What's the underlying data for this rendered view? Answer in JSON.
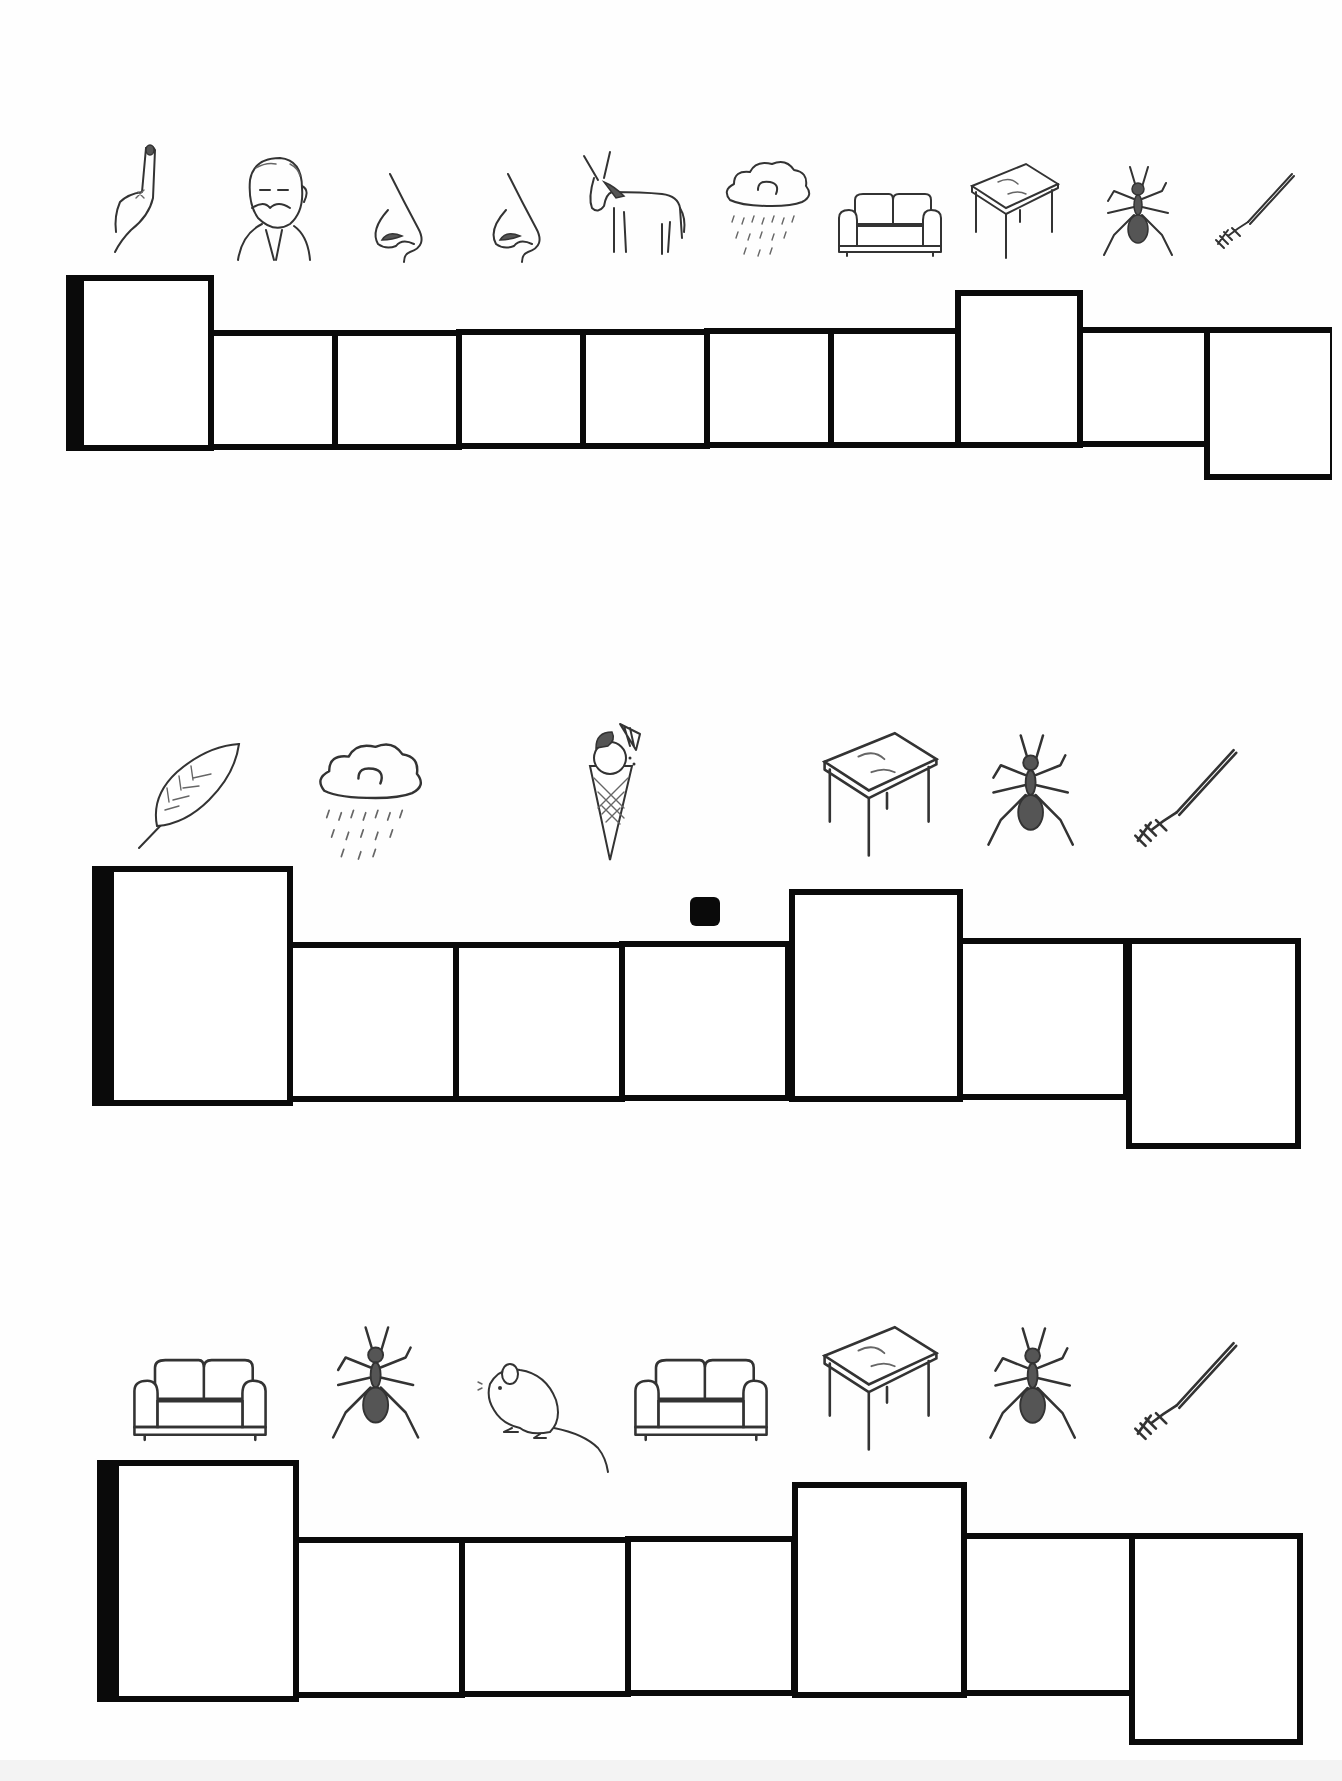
{
  "worksheet": {
    "rows": [
      {
        "pictures": [
          "finger",
          "old-man",
          "nose",
          "nose",
          "donkey",
          "rain-cloud",
          "sofa",
          "table",
          "ant",
          "fork"
        ],
        "cells": [
          {
            "kind": "first",
            "x": 66,
            "y": 275,
            "w": 148,
            "h": 176
          },
          {
            "kind": "normal",
            "x": 208,
            "y": 330,
            "w": 130,
            "h": 120
          },
          {
            "kind": "normal",
            "x": 332,
            "y": 330,
            "w": 130,
            "h": 120
          },
          {
            "kind": "normal",
            "x": 456,
            "y": 329,
            "w": 130,
            "h": 120
          },
          {
            "kind": "normal",
            "x": 580,
            "y": 329,
            "w": 130,
            "h": 120
          },
          {
            "kind": "normal",
            "x": 704,
            "y": 328,
            "w": 130,
            "h": 120
          },
          {
            "kind": "normal",
            "x": 828,
            "y": 328,
            "w": 133,
            "h": 120
          },
          {
            "kind": "tall",
            "x": 955,
            "y": 290,
            "w": 128,
            "h": 158
          },
          {
            "kind": "normal",
            "x": 1077,
            "y": 327,
            "w": 133,
            "h": 120
          },
          {
            "kind": "low",
            "x": 1204,
            "y": 327,
            "w": 128,
            "h": 153
          }
        ]
      },
      {
        "pictures": [
          "feather",
          "rain-cloud",
          "ice-cream",
          "table",
          "ant",
          "fork"
        ],
        "cells": [
          {
            "kind": "first",
            "x": 92,
            "y": 866,
            "w": 201,
            "h": 240
          },
          {
            "kind": "normal",
            "x": 287,
            "y": 942,
            "w": 172,
            "h": 160
          },
          {
            "kind": "normal",
            "x": 453,
            "y": 942,
            "w": 172,
            "h": 160
          },
          {
            "kind": "normal",
            "x": 619,
            "y": 941,
            "w": 172,
            "h": 160
          },
          {
            "kind": "tall",
            "x": 789,
            "y": 889,
            "w": 174,
            "h": 213
          },
          {
            "kind": "normal",
            "x": 957,
            "y": 938,
            "w": 172,
            "h": 162
          },
          {
            "kind": "low",
            "x": 1126,
            "y": 938,
            "w": 175,
            "h": 211
          }
        ],
        "marker": {
          "x": 690,
          "y": 897,
          "w": 30,
          "h": 29
        }
      },
      {
        "pictures": [
          "sofa",
          "ant",
          "mouse",
          "sofa",
          "table",
          "ant",
          "fork"
        ],
        "cells": [
          {
            "kind": "first",
            "x": 97,
            "y": 1460,
            "w": 202,
            "h": 242
          },
          {
            "kind": "normal",
            "x": 293,
            "y": 1537,
            "w": 172,
            "h": 161
          },
          {
            "kind": "normal",
            "x": 459,
            "y": 1537,
            "w": 172,
            "h": 160
          },
          {
            "kind": "normal",
            "x": 625,
            "y": 1536,
            "w": 172,
            "h": 160
          },
          {
            "kind": "tall",
            "x": 792,
            "y": 1482,
            "w": 175,
            "h": 216
          },
          {
            "kind": "normal",
            "x": 961,
            "y": 1533,
            "w": 174,
            "h": 163
          },
          {
            "kind": "low",
            "x": 1129,
            "y": 1533,
            "w": 174,
            "h": 212
          }
        ]
      }
    ],
    "colors": {
      "ink": "#0a0a0a",
      "paper": "#fefefe",
      "sketch": "#333333"
    }
  }
}
